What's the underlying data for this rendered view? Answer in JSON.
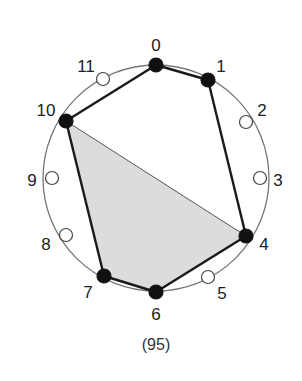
{
  "diagram": {
    "caption": "(95)",
    "circle": {
      "cx": 156,
      "cy": 178,
      "r": 113,
      "stroke": "#777777"
    },
    "colors": {
      "filled_node": "#111111",
      "empty_node": "#ffffff",
      "edge": "#1a1a1a",
      "region_fill": "#dcdcdc"
    },
    "nodes": [
      {
        "id": "0",
        "x": 156,
        "y": 65,
        "filled": true,
        "label_x": 156,
        "label_y": 45
      },
      {
        "id": "1",
        "x": 208,
        "y": 80,
        "filled": true,
        "label_x": 221,
        "label_y": 66
      },
      {
        "id": "2",
        "x": 246,
        "y": 122,
        "filled": false,
        "label_x": 262,
        "label_y": 110
      },
      {
        "id": "3",
        "x": 260,
        "y": 178,
        "filled": false,
        "label_x": 278,
        "label_y": 180
      },
      {
        "id": "4",
        "x": 246,
        "y": 236,
        "filled": true,
        "label_x": 264,
        "label_y": 244
      },
      {
        "id": "5",
        "x": 208,
        "y": 277,
        "filled": false,
        "label_x": 222,
        "label_y": 293
      },
      {
        "id": "6",
        "x": 156,
        "y": 292,
        "filled": true,
        "label_x": 156,
        "label_y": 314
      },
      {
        "id": "7",
        "x": 104,
        "y": 276,
        "filled": true,
        "label_x": 88,
        "label_y": 292
      },
      {
        "id": "8",
        "x": 66,
        "y": 235,
        "filled": false,
        "label_x": 46,
        "label_y": 244
      },
      {
        "id": "9",
        "x": 52,
        "y": 178,
        "filled": false,
        "label_x": 32,
        "label_y": 180
      },
      {
        "id": "10",
        "x": 66,
        "y": 121,
        "filled": true,
        "label_x": 46,
        "label_y": 110
      },
      {
        "id": "11",
        "x": 103,
        "y": 79,
        "filled": false,
        "label_x": 86,
        "label_y": 66
      }
    ],
    "polygon_edges": [
      "0-1",
      "1-4",
      "4-6",
      "6-7",
      "7-10",
      "10-0"
    ],
    "shaded_region": [
      "10",
      "4",
      "6",
      "7"
    ]
  }
}
